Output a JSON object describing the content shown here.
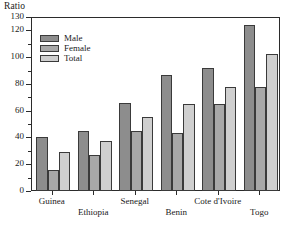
{
  "chart_data": {
    "type": "bar",
    "title": "",
    "ylabel": "Ratio",
    "xlabel": "",
    "ylim": [
      0,
      130
    ],
    "y_major_ticks": [
      0,
      20,
      40,
      60,
      80,
      100,
      120,
      130
    ],
    "y_major_labels": [
      "0",
      "20",
      "40",
      "60",
      "80",
      "100",
      "120",
      "130"
    ],
    "y_minor_ticks": [
      10,
      30,
      50,
      70,
      90,
      110
    ],
    "grid": false,
    "legend_position": "upper-left-inside",
    "categories": [
      "Guinea",
      "Ethiopia",
      "Senegal",
      "Benin",
      "Cote d'Ivoire",
      "Togo"
    ],
    "series": [
      {
        "name": "Male",
        "color": "#8d8d8d",
        "values": [
          40,
          45,
          66,
          87,
          92,
          124
        ]
      },
      {
        "name": "Female",
        "color": "#a8a8a8",
        "values": [
          16,
          27,
          45,
          43,
          65,
          78
        ]
      },
      {
        "name": "Total",
        "color": "#cfcfcf",
        "values": [
          29,
          37,
          55,
          65,
          78,
          102
        ]
      }
    ]
  },
  "legend": {
    "items": [
      {
        "label": "Male"
      },
      {
        "label": "Female"
      },
      {
        "label": "Total"
      }
    ]
  },
  "axis": {
    "y_title": "Ratio"
  }
}
